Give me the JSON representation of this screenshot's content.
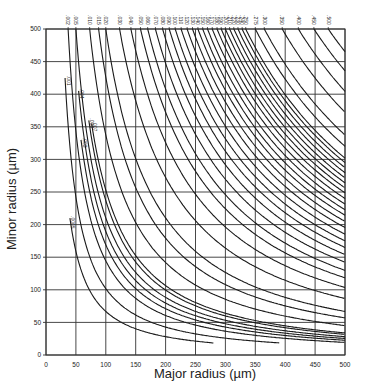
{
  "chart_data": {
    "type": "line",
    "title": "",
    "xlabel": "Major radius (µm)",
    "ylabel": "Minor radius (µm)",
    "xlim": [
      0,
      500
    ],
    "ylim": [
      0,
      500
    ],
    "grid": true,
    "x_ticks": [
      "0",
      "50",
      "100",
      "150",
      "200",
      "250",
      "300",
      "350",
      "400",
      "450",
      "500"
    ],
    "y_ticks": [
      "0",
      "50",
      "100",
      "150",
      "200",
      "250",
      "300",
      "350",
      "400",
      "450",
      "500"
    ],
    "series": [
      {
        "name": ".0005",
        "top_major": 20,
        "label_pos": "inline",
        "end_minor": 210
      },
      {
        "name": ".001",
        "top_major": 28,
        "label_pos": "inline",
        "end_minor": 425
      },
      {
        "name": ".002",
        "top_major": 37
      },
      {
        "name": ".003",
        "top_major": 42,
        "label_pos": "inline",
        "end_minor": 330
      },
      {
        "name": ".004",
        "top_major": 46,
        "label_pos": "inline",
        "end_minor": 405
      },
      {
        "name": ".005",
        "top_major": 50
      },
      {
        "name": ".006",
        "top_major": 55,
        "label_pos": "inline",
        "end_minor": 360
      },
      {
        "name": ".007",
        "top_major": 58,
        "label_pos": "inline",
        "end_minor": 355
      },
      {
        "name": ".010",
        "top_major": 73
      },
      {
        "name": ".015",
        "top_major": 88
      },
      {
        "name": ".020",
        "top_major": 100
      },
      {
        "name": ".030",
        "top_major": 123
      },
      {
        "name": ".040",
        "top_major": 142
      },
      {
        "name": ".050",
        "top_major": 158
      },
      {
        "name": ".060",
        "top_major": 170
      },
      {
        "name": ".070",
        "top_major": 183
      },
      {
        "name": ".080",
        "top_major": 195
      },
      {
        "name": ".090",
        "top_major": 206
      },
      {
        "name": ".100",
        "top_major": 216
      },
      {
        "name": ".110",
        "top_major": 226
      },
      {
        "name": ".120",
        "top_major": 236
      },
      {
        "name": ".130",
        "top_major": 245
      },
      {
        "name": ".140",
        "top_major": 254
      },
      {
        "name": ".150",
        "top_major": 262
      },
      {
        "name": ".160",
        "top_major": 270
      },
      {
        "name": ".170",
        "top_major": 278
      },
      {
        "name": ".180",
        "top_major": 286
      },
      {
        "name": ".190",
        "top_major": 293
      },
      {
        "name": ".200",
        "top_major": 300
      },
      {
        "name": ".210",
        "top_major": 307
      },
      {
        "name": ".220",
        "top_major": 314
      },
      {
        "name": ".230",
        "top_major": 321
      },
      {
        "name": ".240",
        "top_major": 328
      },
      {
        "name": ".250",
        "top_major": 334
      },
      {
        "name": ".275",
        "top_major": 350
      },
      {
        "name": ".300",
        "top_major": 365
      },
      {
        "name": ".350",
        "top_major": 395
      },
      {
        "name": ".400",
        "top_major": 422
      },
      {
        "name": ".450",
        "top_major": 448
      },
      {
        "name": ".500",
        "top_major": 472
      }
    ],
    "bottom_endpoints": [
      {
        "major": 80,
        "minor": 20
      },
      {
        "major": 100,
        "minor": 25
      },
      {
        "major": 150,
        "minor": 20
      },
      {
        "major": 190,
        "minor": 20
      },
      {
        "major": 250,
        "minor": 20
      },
      {
        "major": 270,
        "minor": 25
      },
      {
        "major": 350,
        "minor": 20
      },
      {
        "major": 420,
        "minor": 20
      },
      {
        "major": 460,
        "minor": 25
      }
    ]
  },
  "axes": {
    "xlabel": "Major radius (µm)",
    "ylabel": "Minor radius (µm)"
  },
  "colors": {
    "line": "#1a1a1a",
    "grid": "#333333",
    "background": "#ffffff"
  }
}
